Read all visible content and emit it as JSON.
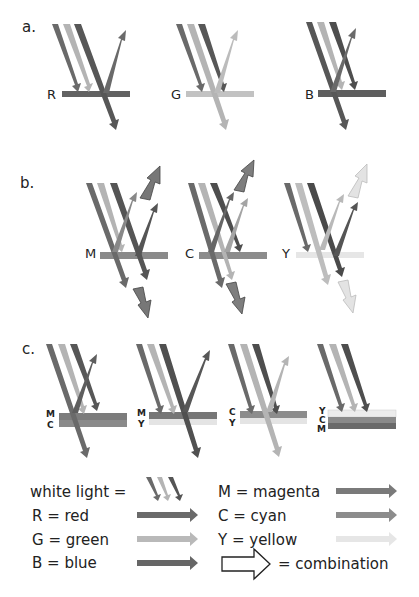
{
  "colors": {
    "red": "#6a6a6a",
    "green": "#b4b4b4",
    "blue": "#575757",
    "magenta": "#7c7c7c",
    "cyan": "#8a8a8a",
    "yellow": "#e2e2e2",
    "outline": "#333333"
  },
  "sections": {
    "a": {
      "label": "a.",
      "panels": [
        {
          "filter": "R",
          "name": "red filter"
        },
        {
          "filter": "G",
          "name": "green filter"
        },
        {
          "filter": "B",
          "name": "blue filter"
        }
      ]
    },
    "b": {
      "label": "b.",
      "panels": [
        {
          "filter": "M",
          "name": "magenta filter"
        },
        {
          "filter": "C",
          "name": "cyan filter"
        },
        {
          "filter": "Y",
          "name": "yellow filter"
        }
      ]
    },
    "c": {
      "label": "c.",
      "panels": [
        {
          "top": "M",
          "bottom": "C"
        },
        {
          "top": "M",
          "bottom": "Y"
        },
        {
          "top": "C",
          "bottom": "Y"
        },
        {
          "top": "Y",
          "middle": "C",
          "bottom": "M"
        }
      ]
    }
  },
  "legend": {
    "white_light": "white light =",
    "r": "R  =  red",
    "g": "G  =  green",
    "b": "B  =  blue",
    "m": "M = magenta",
    "c": "C = cyan",
    "y": "Y = yellow",
    "combination": "= combination"
  }
}
